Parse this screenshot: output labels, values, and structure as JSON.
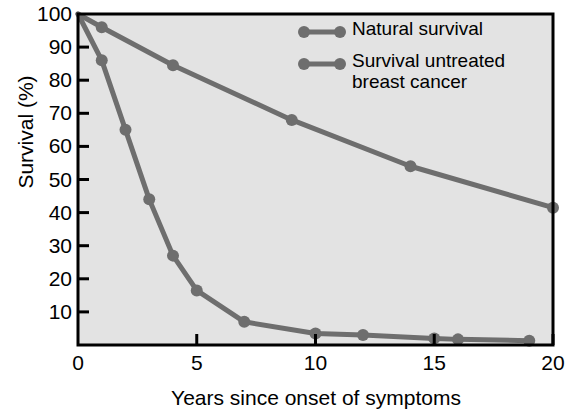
{
  "chart_data": {
    "type": "line",
    "title": "",
    "xlabel": "Years since onset of symptoms",
    "ylabel": "Survival (%)",
    "xlim": [
      0,
      20
    ],
    "ylim": [
      0,
      100
    ],
    "xticks": [
      0,
      5,
      10,
      15,
      20
    ],
    "yticks": [
      10,
      20,
      30,
      40,
      50,
      60,
      70,
      80,
      90,
      100
    ],
    "grid": false,
    "legend_position": "top-right",
    "series": [
      {
        "name": "Natural survival",
        "color": "#6e6e6e",
        "x": [
          0,
          1,
          4,
          9,
          14,
          20
        ],
        "y": [
          100,
          96,
          84.5,
          68,
          54,
          41.5
        ]
      },
      {
        "name": "Survival untreated breast cancer",
        "color": "#6e6e6e",
        "x": [
          0,
          1,
          2,
          3,
          4,
          5,
          7,
          10,
          12,
          15,
          16,
          19
        ],
        "y": [
          100,
          86,
          65,
          44,
          27,
          16.5,
          7,
          3.5,
          3,
          2,
          1.7,
          1.3
        ]
      }
    ],
    "legend_entries": [
      "Natural survival",
      "Survival untreated\nbreast cancer"
    ],
    "colors": {
      "plot_background": "#e3e3e3",
      "line": "#6e6e6e",
      "axis": "#000000",
      "page_background": "#ffffff",
      "text": "#000000"
    },
    "ytick_labels": [
      "100",
      "90",
      "80",
      "70",
      "60",
      "50",
      "40",
      "30",
      "20",
      "10"
    ],
    "xtick_labels": [
      "0",
      "5",
      "10",
      "15",
      "20"
    ]
  }
}
